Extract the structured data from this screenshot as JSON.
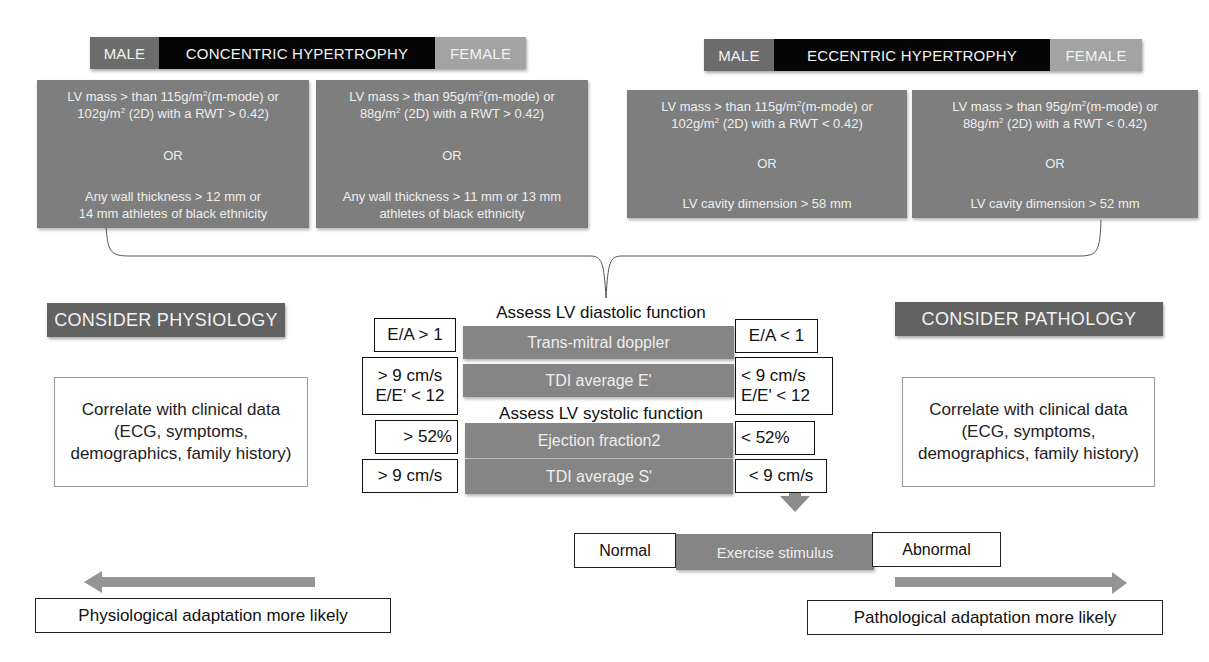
{
  "concentric": {
    "male_label": "MALE",
    "title": "CONCENTRIC HYPERTROPHY",
    "female_label": "FEMALE",
    "male_criteria": {
      "line1a": "LV mass > than 115g/m",
      "sup1": "2",
      "line1b": "(m-mode) or",
      "line2a": "102g/m",
      "sup2": "2",
      "line2b": " (2D) with a RWT > 0.42)",
      "or": "OR",
      "line3": "Any wall thickness > 12 mm or",
      "line4": "14 mm athletes of black ethnicity"
    },
    "female_criteria": {
      "line1a": "LV mass > than 95g/m",
      "sup1": "2",
      "line1b": "(m-mode) or",
      "line2a": "88g/m",
      "sup2": "2",
      "line2b": " (2D) with a RWT > 0.42)",
      "or": "OR",
      "line3": "Any wall thickness > 11 mm or 13 mm",
      "line4": "athletes of black ethnicity"
    }
  },
  "eccentric": {
    "male_label": "MALE",
    "title": "ECCENTRIC HYPERTROPHY",
    "female_label": "FEMALE",
    "male_criteria": {
      "line1a": "LV mass > than 115g/m",
      "sup1": "2",
      "line1b": "(m-mode) or",
      "line2a": "102g/m",
      "sup2": "2",
      "line2b": " (2D) with a RWT < 0.42)",
      "or": "OR",
      "line3": "LV cavity dimension > 58 mm"
    },
    "female_criteria": {
      "line1a": "LV mass > than 95g/m",
      "sup1": "2",
      "line1b": "(m-mode) or",
      "line2a": "88g/m",
      "sup2": "2",
      "line2b": " (2D) with a RWT < 0.42)",
      "or": "OR",
      "line3": "LV cavity dimension > 52 mm"
    }
  },
  "physiology": {
    "header": "CONSIDER PHYSIOLOGY",
    "clinical": "Correlate with clinical data (ECG, symptoms, demographics, family history)",
    "outcome": "Physiological adaptation more likely"
  },
  "pathology": {
    "header": "CONSIDER PATHOLOGY",
    "clinical": "Correlate with clinical data (ECG, symptoms, demographics, family history)",
    "outcome": "Pathological adaptation more likely"
  },
  "assessment": {
    "diastolic_label": "Assess LV diastolic function",
    "systolic_label": "Assess LV systolic function",
    "rows": [
      {
        "test": "Trans-mitral doppler",
        "left": [
          "E/A > 1"
        ],
        "right": [
          "E/A < 1"
        ]
      },
      {
        "test": "TDI average E'",
        "left": [
          "> 9 cm/s",
          "E/E' < 12"
        ],
        "right": [
          "< 9 cm/s",
          "E/E' < 12"
        ]
      },
      {
        "test": "Ejection fraction2",
        "left": [
          "> 52%"
        ],
        "right": [
          "< 52%"
        ]
      },
      {
        "test": "TDI average S'",
        "left": [
          "> 9 cm/s"
        ],
        "right": [
          "< 9 cm/s"
        ]
      }
    ]
  },
  "exercise": {
    "normal": "Normal",
    "stimulus": "Exercise stimulus",
    "abnormal": "Abnormal"
  },
  "colors": {
    "dark_bar": "#050505",
    "male_bar": "#6c6c6c",
    "female_bar": "#a3a3a3",
    "criteria_box": "#7e7e7e",
    "consider_header": "#626262",
    "arrow": "#909090"
  }
}
